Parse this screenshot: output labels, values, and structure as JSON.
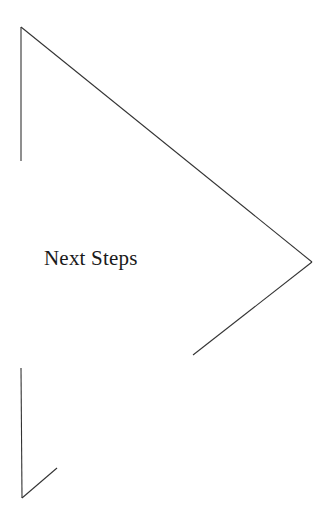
{
  "slide": {
    "title": "Next Steps",
    "background_color": "#ffffff",
    "text_color": "#1a1a1a",
    "width": 330,
    "height": 520
  },
  "graphics": {
    "stroke_color": "#333333",
    "stroke_width": 1,
    "shapes": [
      {
        "name": "chevron-arrow-outline",
        "description": "large open right-pointing chevron outline",
        "points": "21,27 21,161"
      },
      {
        "name": "chevron-upper-diagonal",
        "description": "long diagonal from upper-left down to right apex",
        "points": "21,27 312,262"
      },
      {
        "name": "chevron-lower-diagonal",
        "description": "diagonal from right apex down-left",
        "points": "312,262 193,355"
      },
      {
        "name": "lower-arrow-vertical",
        "description": "vertical stroke of lower-left arrow",
        "points": "21,368 22,498"
      },
      {
        "name": "lower-arrow-diagonal",
        "description": "diagonal barb of lower-left arrow",
        "points": "22,498 57,468"
      }
    ]
  }
}
